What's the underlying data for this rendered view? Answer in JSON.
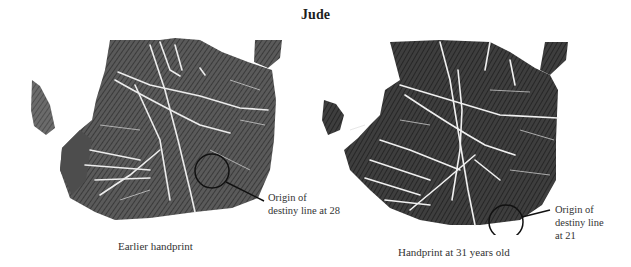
{
  "title": "Jude",
  "left_print": {
    "caption": "Earlier handprint",
    "annotation": {
      "line1": "Origin of",
      "line2": "destiny line at 28"
    }
  },
  "right_print": {
    "caption": "Handprint at 31 years old",
    "annotation": {
      "line1": "Origin of",
      "line2": "destiny line",
      "line3": "at 21"
    }
  },
  "colors": {
    "ink": "#3c3c3c",
    "ink_dark": "#2a2a2a",
    "crease": "#e8e8e8",
    "marker": "#111111"
  }
}
